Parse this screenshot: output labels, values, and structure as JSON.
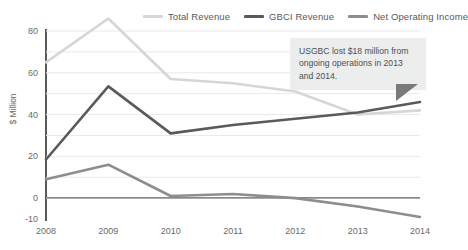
{
  "chart_data": {
    "type": "line",
    "title": "",
    "xlabel": "",
    "ylabel": "$ Million",
    "x": [
      "2008",
      "2009",
      "2010",
      "2011",
      "2012",
      "2013",
      "2014"
    ],
    "categories": [
      "2008",
      "2009",
      "2010",
      "2011",
      "2012",
      "2013",
      "2014"
    ],
    "series": [
      {
        "name": "Total Revenue",
        "color": "#d6d6d6",
        "values": [
          65,
          86,
          57,
          55,
          51,
          40,
          42
        ]
      },
      {
        "name": "GBCI Revenue",
        "color": "#5a5a5c",
        "values": [
          18.5,
          53.5,
          31,
          35,
          38,
          41,
          46
        ]
      },
      {
        "name": "Net Operating Income",
        "color": "#8d8d8f",
        "values": [
          9,
          16,
          1,
          2,
          0,
          -4,
          -9
        ]
      }
    ],
    "ylim": [
      -10,
      80
    ],
    "yticks": [
      80,
      60,
      40,
      20,
      0,
      -10
    ],
    "ytick_labels": [
      "80",
      "60",
      "40",
      "20",
      "0",
      "-10"
    ],
    "gridlines": [
      80,
      70,
      60,
      50,
      40,
      30,
      20,
      10,
      0
    ],
    "grid": true,
    "legend_position": "top-right"
  },
  "legend": {
    "items": [
      {
        "label": "Total Revenue",
        "color": "#d6d6d6"
      },
      {
        "label": "GBCI Revenue",
        "color": "#5a5a5c"
      },
      {
        "label": "Net Operating Income",
        "color": "#8d8d8f"
      }
    ]
  },
  "annotation": {
    "text": "USGBC lost $18 million from ongoing operations in 2013 and 2014."
  }
}
